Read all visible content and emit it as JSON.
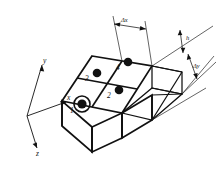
{
  "figure": {
    "kind": "3d-mesh-diagram",
    "background_color": "#ffffff",
    "line_color": "#111111"
  },
  "axes": {
    "items": [
      {
        "id": "y",
        "label": "y",
        "direction": "up-right"
      },
      {
        "id": "x",
        "label": "x",
        "direction": "right"
      },
      {
        "id": "z",
        "label": "z",
        "direction": "down-right"
      }
    ]
  },
  "nodes": [
    {
      "id": 1,
      "label": "1",
      "highlighted": true,
      "marker": "filled-circle-with-ring"
    },
    {
      "id": 2,
      "label": "2",
      "highlighted": false,
      "marker": "filled-circle"
    },
    {
      "id": 3,
      "label": "3",
      "highlighted": false,
      "marker": "filled-circle"
    },
    {
      "id": 4,
      "label": "4",
      "highlighted": false,
      "marker": "filled-circle"
    }
  ],
  "dimensions": [
    {
      "id": "dx",
      "label": "Δx",
      "orientation": "along-x",
      "position": "top"
    },
    {
      "id": "h",
      "label": "h",
      "orientation": "vertical",
      "position": "right"
    },
    {
      "id": "dy",
      "label": "Δy",
      "orientation": "along-y",
      "position": "right"
    }
  ]
}
